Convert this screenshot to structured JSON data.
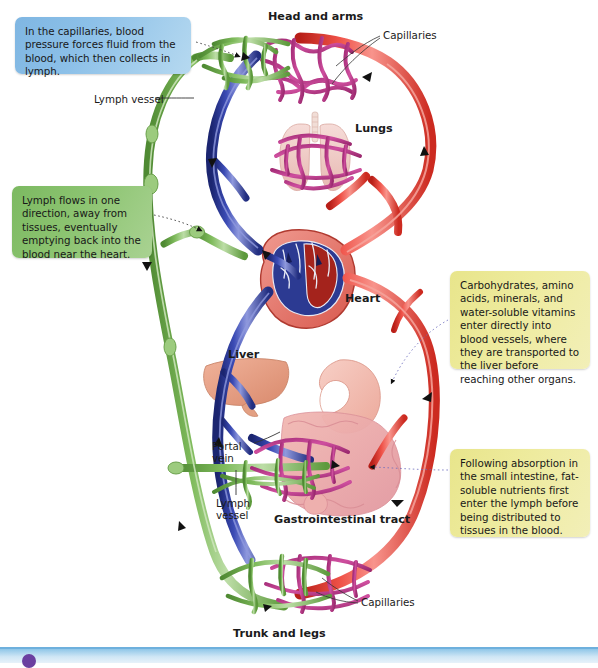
{
  "figure": {
    "colors": {
      "artery_red": "#e03a32",
      "vein_blue": "#2f3f9e",
      "lymph_green": "#79b757",
      "capillary_magenta": "#c0398f",
      "callout_blue": "#8cc0e8",
      "callout_green": "#8cc471",
      "callout_yellow": "#eeeb9e",
      "text": "#1a1a1a"
    }
  },
  "callouts": [
    {
      "id": "capillary-pressure",
      "color": "blue",
      "text": "In the capillaries, blood pressure forces fluid from the blood, which then collects in lymph."
    },
    {
      "id": "lymph-flow",
      "color": "green",
      "text": "Lymph flows in one direction, away from tissues, eventually emptying back into the blood near the heart."
    },
    {
      "id": "water-soluble-nutrients",
      "color": "yellow",
      "text": "Carbohydrates, amino acids, minerals, and water-soluble vitamins enter directly into blood vessels, where they are transported to the liver before reaching other organs."
    },
    {
      "id": "fat-soluble-nutrients",
      "color": "yellow",
      "text": "Following absorption in the small intestine, fat-soluble nutrients first enter the lymph before being distributed to tissues in the blood."
    }
  ],
  "labels": {
    "head_and_arms": "Head and arms",
    "capillaries_top": "Capillaries",
    "lymph_vessel_top": "Lymph vessel",
    "lungs": "Lungs",
    "heart": "Heart",
    "liver": "Liver",
    "portal_vein": "Portal vein",
    "lymph_vessel_gi": "Lymph vessel",
    "gastrointestinal_tract": "Gastrointestinal tract",
    "capillaries_bottom": "Capillaries",
    "trunk_and_legs": "Trunk and legs"
  }
}
